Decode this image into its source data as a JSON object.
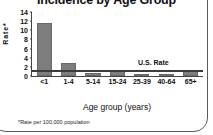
{
  "chart_data": {
    "type": "bar",
    "title": "Incidence by Age Group",
    "xlabel": "Age group (years)",
    "ylabel": "Rate*",
    "footnote": "*Rate per 100,000 population",
    "categories": [
      "<1",
      "1-4",
      "5-14",
      "15-24",
      "25-39",
      "40-64",
      "65+"
    ],
    "values": [
      11.5,
      2.8,
      0.6,
      1.3,
      0.4,
      0.5,
      1.2
    ],
    "ylim": [
      0,
      14
    ],
    "yticks": [
      0,
      2,
      4,
      6,
      8,
      10,
      12,
      14
    ],
    "grid": false,
    "legend": "none",
    "bar_color": "#7e7e7e",
    "axis_color": "#444444",
    "annotations": [
      {
        "name": "us-rate-line",
        "label": "U.S. Rate",
        "value": 1.2,
        "style": "horizontal-reference-line",
        "color": "#3c3c3c"
      }
    ]
  }
}
